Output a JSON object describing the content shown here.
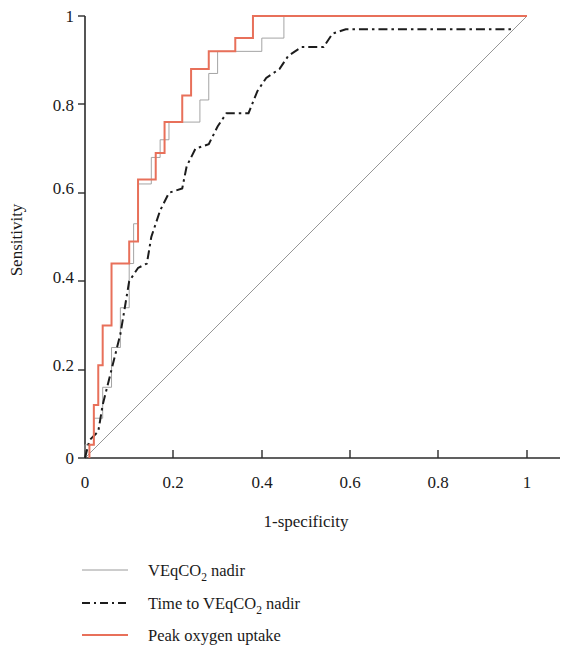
{
  "chart_data": {
    "type": "line",
    "title": "",
    "xlabel": "1-specificity",
    "ylabel": "Sensitivity",
    "xlim": [
      0,
      1
    ],
    "ylim": [
      0,
      1
    ],
    "xticks": [
      "0",
      "0.2",
      "0.4",
      "0.6",
      "0.8",
      "1"
    ],
    "xtick_values": [
      0,
      0.2,
      0.4,
      0.6,
      0.8,
      1
    ],
    "yticks": [
      "0",
      "0.2",
      "0.4",
      "0.6",
      "0.8",
      "1"
    ],
    "ytick_values": [
      0,
      0.2,
      0.4,
      0.6,
      0.8,
      1
    ],
    "grid": false,
    "legend_position": "below-center",
    "series": [
      {
        "name": "VEqCO2 nadir",
        "label_main": "VEqCO",
        "label_sub": "2",
        "label_tail": " nadir",
        "color": "#9a9a9a",
        "style": "solid",
        "width": 0.9,
        "points": [
          [
            0.0,
            0.0
          ],
          [
            0.0,
            0.03
          ],
          [
            0.02,
            0.03
          ],
          [
            0.02,
            0.09
          ],
          [
            0.04,
            0.09
          ],
          [
            0.04,
            0.16
          ],
          [
            0.06,
            0.16
          ],
          [
            0.06,
            0.25
          ],
          [
            0.08,
            0.25
          ],
          [
            0.08,
            0.34
          ],
          [
            0.1,
            0.34
          ],
          [
            0.1,
            0.44
          ],
          [
            0.11,
            0.44
          ],
          [
            0.11,
            0.53
          ],
          [
            0.12,
            0.53
          ],
          [
            0.12,
            0.62
          ],
          [
            0.15,
            0.62
          ],
          [
            0.15,
            0.68
          ],
          [
            0.17,
            0.68
          ],
          [
            0.17,
            0.72
          ],
          [
            0.19,
            0.72
          ],
          [
            0.19,
            0.76
          ],
          [
            0.26,
            0.76
          ],
          [
            0.26,
            0.81
          ],
          [
            0.28,
            0.81
          ],
          [
            0.28,
            0.87
          ],
          [
            0.3,
            0.87
          ],
          [
            0.3,
            0.92
          ],
          [
            0.4,
            0.92
          ],
          [
            0.4,
            0.95
          ],
          [
            0.45,
            0.95
          ],
          [
            0.45,
            1.0
          ],
          [
            1.0,
            1.0
          ]
        ]
      },
      {
        "name": "Time to VEqCO2 nadir",
        "label_main": "Time to VEqCO",
        "label_sub": "2",
        "label_tail": " nadir",
        "color": "#1c1c1c",
        "style": "dash-dot",
        "width": 2.0,
        "points": [
          [
            0.0,
            0.0
          ],
          [
            0.01,
            0.04
          ],
          [
            0.03,
            0.06
          ],
          [
            0.04,
            0.12
          ],
          [
            0.06,
            0.2
          ],
          [
            0.08,
            0.28
          ],
          [
            0.09,
            0.34
          ],
          [
            0.1,
            0.4
          ],
          [
            0.12,
            0.43
          ],
          [
            0.14,
            0.44
          ],
          [
            0.15,
            0.5
          ],
          [
            0.17,
            0.56
          ],
          [
            0.19,
            0.6
          ],
          [
            0.22,
            0.61
          ],
          [
            0.23,
            0.66
          ],
          [
            0.25,
            0.7
          ],
          [
            0.28,
            0.71
          ],
          [
            0.3,
            0.75
          ],
          [
            0.32,
            0.78
          ],
          [
            0.37,
            0.78
          ],
          [
            0.39,
            0.83
          ],
          [
            0.41,
            0.86
          ],
          [
            0.44,
            0.88
          ],
          [
            0.46,
            0.91
          ],
          [
            0.49,
            0.93
          ],
          [
            0.54,
            0.93
          ],
          [
            0.56,
            0.96
          ],
          [
            0.59,
            0.97
          ],
          [
            0.97,
            0.97
          ]
        ]
      },
      {
        "name": "Peak oxygen uptake",
        "label_main": "Peak oxygen uptake",
        "label_sub": "",
        "label_tail": "",
        "color": "#e8705a",
        "style": "solid",
        "width": 2.0,
        "points": [
          [
            0.01,
            0.0
          ],
          [
            0.01,
            0.03
          ],
          [
            0.02,
            0.03
          ],
          [
            0.02,
            0.12
          ],
          [
            0.03,
            0.12
          ],
          [
            0.03,
            0.21
          ],
          [
            0.04,
            0.21
          ],
          [
            0.04,
            0.3
          ],
          [
            0.06,
            0.3
          ],
          [
            0.06,
            0.44
          ],
          [
            0.1,
            0.44
          ],
          [
            0.1,
            0.49
          ],
          [
            0.12,
            0.49
          ],
          [
            0.12,
            0.63
          ],
          [
            0.16,
            0.63
          ],
          [
            0.16,
            0.69
          ],
          [
            0.18,
            0.69
          ],
          [
            0.18,
            0.76
          ],
          [
            0.22,
            0.76
          ],
          [
            0.22,
            0.82
          ],
          [
            0.24,
            0.82
          ],
          [
            0.24,
            0.88
          ],
          [
            0.28,
            0.88
          ],
          [
            0.28,
            0.92
          ],
          [
            0.34,
            0.92
          ],
          [
            0.34,
            0.95
          ],
          [
            0.38,
            0.95
          ],
          [
            0.38,
            1.0
          ],
          [
            1.0,
            1.0
          ]
        ]
      },
      {
        "name": "reference diagonal",
        "label_main": "",
        "label_sub": "",
        "label_tail": "",
        "color": "#8a8a8a",
        "style": "solid",
        "width": 0.9,
        "points": [
          [
            0.0,
            0.0
          ],
          [
            1.0,
            1.0
          ]
        ]
      }
    ]
  },
  "legend": {
    "items": [
      {
        "text_main": "VEqCO",
        "text_sub": "2",
        "text_tail": " nadir",
        "swatch": "thin-gray-line"
      },
      {
        "text_main": "Time to VEqCO",
        "text_sub": "2",
        "text_tail": " nadir",
        "swatch": "black-dash-dot-line"
      },
      {
        "text_main": "Peak oxygen uptake",
        "text_sub": "",
        "text_tail": "",
        "swatch": "red-solid-line"
      }
    ]
  }
}
